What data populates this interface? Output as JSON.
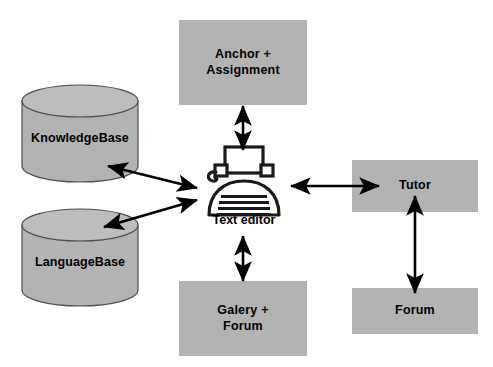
{
  "diagram": {
    "type": "system-architecture-block-diagram",
    "background_color": "#ffffff",
    "node_fill_color": "#b3b3b3",
    "stroke_color": "#000000",
    "center": {
      "label": "Text editor",
      "icon": "typewriter-icon"
    },
    "nodes": [
      {
        "id": "knowledgebase",
        "label": "KnowledgeBase",
        "shape": "cylinder"
      },
      {
        "id": "languagebase",
        "label": "LanguageBase",
        "shape": "cylinder"
      },
      {
        "id": "anchor-assignment",
        "label": "Anchor +\nAssignment",
        "shape": "rectangle"
      },
      {
        "id": "galery-forum",
        "label": "Galery +\nForum",
        "shape": "rectangle"
      },
      {
        "id": "tutor",
        "label": "Tutor",
        "shape": "rectangle"
      },
      {
        "id": "forum",
        "label": "Forum",
        "shape": "rectangle"
      }
    ],
    "connections": [
      {
        "from": "knowledgebase",
        "to": "center",
        "style": "double-arrow"
      },
      {
        "from": "languagebase",
        "to": "center",
        "style": "double-arrow"
      },
      {
        "from": "anchor-assignment",
        "to": "center",
        "style": "double-arrow"
      },
      {
        "from": "galery-forum",
        "to": "center",
        "style": "double-arrow"
      },
      {
        "from": "tutor",
        "to": "center",
        "style": "double-arrow"
      },
      {
        "from": "forum",
        "to": "tutor",
        "style": "double-arrow"
      }
    ]
  }
}
